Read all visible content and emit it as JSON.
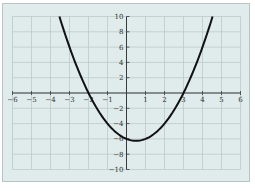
{
  "chart_data": {
    "type": "line",
    "title": "",
    "xlabel": "",
    "ylabel": "",
    "xlim": [
      -6,
      6
    ],
    "ylim": [
      -10,
      10
    ],
    "grid": true,
    "legend": null,
    "x_ticks": [
      -6,
      -5,
      -4,
      -3,
      -2,
      -1,
      1,
      2,
      3,
      4,
      5,
      6
    ],
    "y_ticks": [
      -10,
      -8,
      -6,
      -4,
      -2,
      2,
      4,
      6,
      8,
      10
    ],
    "x_tick_labels": [
      "−6",
      "−5",
      "−4",
      "−3",
      "−2",
      "−1",
      "1",
      "2",
      "3",
      "4",
      "5",
      "6"
    ],
    "y_tick_labels": [
      "−10",
      "−8",
      "−6",
      "−4",
      "−2",
      "2",
      "4",
      "6",
      "8",
      "10"
    ],
    "series": [
      {
        "name": "parabola",
        "equation": "y = x^2 - x - 6",
        "x": [
          -3.53,
          -3,
          -2.5,
          -2,
          -1.5,
          -1,
          -0.5,
          0,
          0.5,
          1,
          1.5,
          2,
          2.5,
          3,
          3.5,
          4,
          4.53
        ],
        "y": [
          10,
          6,
          2.75,
          0,
          -2.25,
          -4,
          -5.25,
          -6,
          -6.25,
          -6,
          -5.25,
          -4,
          -2.25,
          0,
          2.75,
          6,
          10
        ]
      }
    ],
    "annotations": {
      "x_intercepts": [
        -2,
        3
      ],
      "vertex": [
        0.5,
        -6.25
      ],
      "y_intercept": -6
    }
  },
  "style": {
    "background": "#dfeceb",
    "grid_color": "#b7c7c6",
    "axis_color": "#3a3a3a",
    "curve_color": "#111111"
  }
}
